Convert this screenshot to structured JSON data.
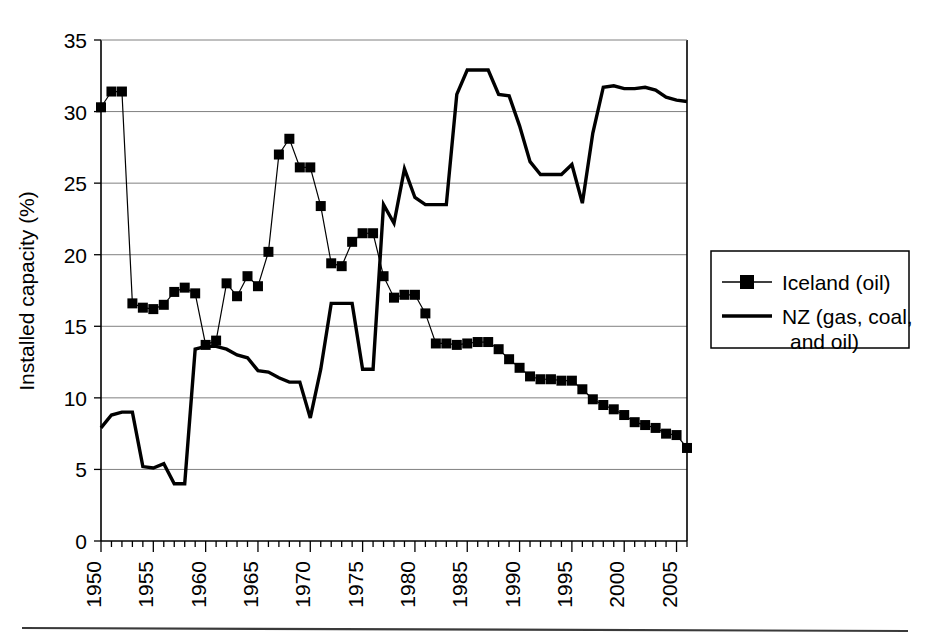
{
  "chart_data": {
    "type": "line",
    "title": "",
    "xlabel": "",
    "ylabel": "Installed capacity (%)",
    "xlim": [
      1950,
      2006
    ],
    "ylim": [
      0,
      35
    ],
    "yticks": [
      0,
      5,
      10,
      15,
      20,
      25,
      30,
      35
    ],
    "ytick_labels": [
      "0",
      "5",
      "10",
      "15",
      "20",
      "25",
      "30",
      "35"
    ],
    "xticks": [
      1950,
      1955,
      1960,
      1965,
      1970,
      1975,
      1980,
      1985,
      1990,
      1995,
      2000,
      2005
    ],
    "xtick_labels": [
      "1950",
      "1955",
      "1960",
      "1965",
      "1970",
      "1975",
      "1980",
      "1985",
      "1990",
      "1995",
      "2000",
      "2005"
    ],
    "grid": "horizontal",
    "legend_position": "right",
    "x": [
      1950,
      1951,
      1952,
      1953,
      1954,
      1955,
      1956,
      1957,
      1958,
      1959,
      1960,
      1961,
      1962,
      1963,
      1964,
      1965,
      1966,
      1967,
      1968,
      1969,
      1970,
      1971,
      1972,
      1973,
      1974,
      1975,
      1976,
      1977,
      1978,
      1979,
      1980,
      1981,
      1982,
      1983,
      1984,
      1985,
      1986,
      1987,
      1988,
      1989,
      1990,
      1991,
      1992,
      1993,
      1994,
      1995,
      1996,
      1997,
      1998,
      1999,
      2000,
      2001,
      2002,
      2003,
      2004,
      2005,
      2006
    ],
    "series": [
      {
        "name": "Iceland (oil)",
        "marker": "filled-square",
        "values": [
          30.3,
          31.4,
          31.4,
          16.6,
          16.3,
          16.2,
          16.5,
          17.4,
          17.7,
          17.3,
          13.7,
          14.0,
          18.0,
          17.1,
          18.5,
          17.8,
          20.2,
          27.0,
          28.1,
          26.1,
          26.1,
          23.4,
          19.4,
          19.2,
          20.9,
          21.5,
          21.5,
          18.5,
          17.0,
          17.2,
          17.2,
          15.9,
          13.8,
          13.8,
          13.7,
          13.8,
          13.9,
          13.9,
          13.4,
          12.7,
          12.1,
          11.5,
          11.3,
          11.3,
          11.2,
          11.2,
          10.6,
          9.9,
          9.5,
          9.2,
          8.8,
          8.3,
          8.1,
          7.9,
          7.5,
          7.4,
          6.5
        ]
      },
      {
        "name": "NZ (gas, coal, and oil)",
        "marker": "none",
        "values": [
          7.9,
          8.8,
          9.0,
          9.0,
          5.2,
          5.1,
          5.4,
          4.0,
          4.0,
          13.4,
          13.6,
          13.6,
          13.4,
          13.0,
          12.8,
          11.9,
          11.8,
          11.4,
          11.1,
          11.1,
          8.6,
          12.0,
          16.6,
          16.6,
          16.6,
          12.0,
          12.0,
          23.5,
          22.2,
          26.0,
          24.0,
          23.5,
          23.5,
          23.5,
          31.2,
          32.9,
          32.9,
          32.9,
          31.2,
          31.1,
          29.0,
          26.5,
          25.6,
          25.6,
          25.6,
          26.3,
          23.6,
          28.5,
          31.7,
          31.8,
          31.6,
          31.6,
          31.7,
          31.5,
          31.0,
          30.8,
          30.7
        ]
      }
    ]
  },
  "legend": {
    "entries": [
      {
        "label": "Iceland (oil)"
      },
      {
        "label_line1": "NZ (gas, coal,",
        "label_line2": "and oil)"
      }
    ]
  }
}
